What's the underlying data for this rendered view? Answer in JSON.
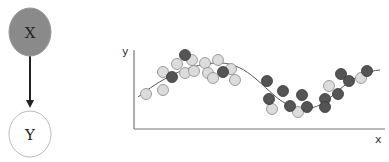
{
  "graph": {
    "nodes": [
      {
        "id": "X",
        "label": "X",
        "cx": 30,
        "cy": 32,
        "rx": 21,
        "ry": 24,
        "fill": "#8a8a8a",
        "stroke": "#999999"
      },
      {
        "id": "Y",
        "label": "Y",
        "cx": 30,
        "cy": 134,
        "rx": 21,
        "ry": 23,
        "fill": "#ffffff",
        "stroke": "#bbbbbb"
      }
    ],
    "edges": [
      {
        "from": "X",
        "to": "Y",
        "x1": 30,
        "y1": 56,
        "x2": 30,
        "y2": 109,
        "color": "#222222"
      }
    ]
  },
  "chart_data": {
    "type": "scatter",
    "title": "",
    "xlabel": "x",
    "ylabel": "y",
    "grid": false,
    "legend": null,
    "axes_px": {
      "origin_x": 134,
      "origin_y": 129,
      "x_end": 385,
      "y_top": 50
    },
    "curve": {
      "description": "smooth sinusoidal regression curve",
      "color": "#555555",
      "path": "M 138 97 C 160 80, 185 65, 215 63 C 245 61, 260 85, 280 100 C 295 110, 310 112, 325 102 C 340 90, 355 72, 380 70"
    },
    "series": [
      {
        "name": "light",
        "color": "#dcdcdc",
        "stroke": "#888888",
        "points": [
          [
            146,
            94
          ],
          [
            163,
            72
          ],
          [
            163,
            90
          ],
          [
            177,
            64
          ],
          [
            185,
            73
          ],
          [
            192,
            60
          ],
          [
            194,
            71
          ],
          [
            205,
            63
          ],
          [
            208,
            73
          ],
          [
            218,
            60
          ],
          [
            213,
            78
          ],
          [
            231,
            69
          ],
          [
            235,
            80
          ],
          [
            272,
            109
          ],
          [
            298,
            112
          ],
          [
            329,
            86
          ],
          [
            361,
            78
          ]
        ]
      },
      {
        "name": "dark",
        "color": "#555555",
        "stroke": "#333333",
        "points": [
          [
            172,
            77
          ],
          [
            185,
            55
          ],
          [
            223,
            72
          ],
          [
            267,
            81
          ],
          [
            269,
            99
          ],
          [
            283,
            91
          ],
          [
            290,
            106
          ],
          [
            302,
            95
          ],
          [
            307,
            107
          ],
          [
            325,
            99
          ],
          [
            325,
            107
          ],
          [
            338,
            94
          ],
          [
            341,
            74
          ],
          [
            349,
            81
          ],
          [
            367,
            71
          ]
        ]
      }
    ],
    "point_radius": 5.5
  }
}
